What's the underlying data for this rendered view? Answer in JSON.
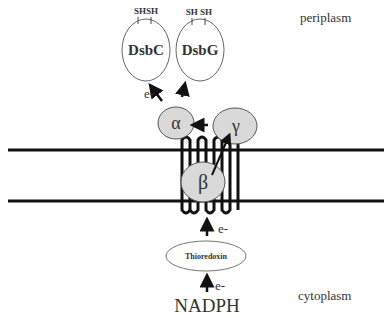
{
  "compartments": {
    "top_label": "periplasm",
    "bottom_label": "cytoplasm"
  },
  "proteins": {
    "dsbc": {
      "label": "DsbC",
      "thiols": "SHSH"
    },
    "dsbg": {
      "label": "DsbG",
      "thiols": "SH SH"
    },
    "alpha": {
      "label": "α"
    },
    "beta": {
      "label": "β"
    },
    "gamma": {
      "label": "γ"
    },
    "thioredoxin": {
      "label": "Thioredoxin"
    }
  },
  "donor": {
    "label": "NADPH"
  },
  "electron_labels": {
    "to_dsbc": "e-",
    "from_thioredoxin": "e-",
    "from_nadph": "e-"
  },
  "colors": {
    "subunit_fill": "#d9d9d9",
    "outline": "#555555",
    "membrane": "#111111"
  }
}
